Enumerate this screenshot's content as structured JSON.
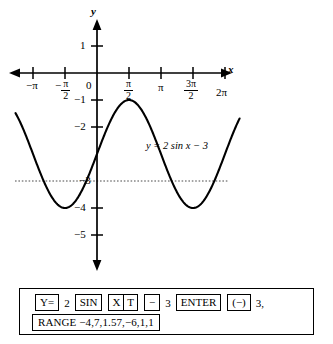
{
  "figure": {
    "equation_label": "y = 2 sin x − 3",
    "axis_labels": {
      "x": "x",
      "y": "y"
    }
  },
  "axes": {
    "x_ticks": [
      {
        "label": "−π",
        "value": -3.1416,
        "type": "plain"
      },
      {
        "label": "−π/2",
        "value": -1.5708,
        "type": "fraction",
        "sign": "−",
        "num": "π",
        "den": "2"
      },
      {
        "label": "0",
        "value": 0,
        "type": "plain"
      },
      {
        "label": "π/2",
        "value": 1.5708,
        "type": "fraction",
        "sign": "",
        "num": "π",
        "den": "2"
      },
      {
        "label": "π",
        "value": 3.1416,
        "type": "plain"
      },
      {
        "label": "3π/2",
        "value": 4.7124,
        "type": "fraction",
        "sign": "",
        "num": "3π",
        "den": "2"
      },
      {
        "label": "2π",
        "value": 6.2832,
        "type": "plain"
      }
    ],
    "y_ticks": [
      {
        "label": "1",
        "value": 1
      },
      {
        "label": "−1",
        "value": -1
      },
      {
        "label": "−2",
        "value": -2
      },
      {
        "label": "−3",
        "value": -3
      },
      {
        "label": "−4",
        "value": -4
      },
      {
        "label": "−5",
        "value": -5
      }
    ],
    "origin_label": "0",
    "x_arrow_left": true,
    "x_arrow_right": true,
    "y_arrow_up": true,
    "y_arrow_down": true
  },
  "chart_data": {
    "type": "line",
    "title": "",
    "subtitle": "",
    "xlabel": "x",
    "ylabel": "y",
    "xlim": [
      -4.0,
      7.0
    ],
    "ylim": [
      -6.0,
      1.6
    ],
    "grid": false,
    "legend": "none",
    "annotations": [
      {
        "text": "y = 2 sin x − 3",
        "x": 2.4,
        "y": -2.05
      }
    ],
    "series": [
      {
        "name": "y = 2 sin x − 3",
        "type": "line",
        "color": "#000000",
        "style": "solid",
        "amplitude": 2,
        "period": 6.2832,
        "vertical_shift": -3,
        "maximum": -1,
        "minimum": -5,
        "midline": -3,
        "key_points": [
          {
            "x": -3.1416,
            "y": -3
          },
          {
            "x": -1.5708,
            "y": -5
          },
          {
            "x": 0,
            "y": -3
          },
          {
            "x": 1.5708,
            "y": -1
          },
          {
            "x": 3.1416,
            "y": -3
          },
          {
            "x": 4.7124,
            "y": -5
          },
          {
            "x": 6.2832,
            "y": -3
          }
        ]
      },
      {
        "name": "midline y = −3",
        "type": "line",
        "color": "#555555",
        "style": "dotted",
        "constant": -3
      }
    ]
  },
  "keystrokes": {
    "row1": [
      {
        "kind": "key",
        "label": "Y="
      },
      {
        "kind": "plain",
        "label": "2"
      },
      {
        "kind": "key",
        "label": "SIN"
      },
      {
        "kind": "key-split",
        "left": "X",
        "right": "T"
      },
      {
        "kind": "key",
        "label": "−"
      },
      {
        "kind": "plain",
        "label": "3"
      },
      {
        "kind": "key",
        "label": "ENTER"
      },
      {
        "kind": "key",
        "label": "(−)"
      },
      {
        "kind": "plain",
        "label": "3,"
      }
    ],
    "row2": [
      {
        "kind": "key-range",
        "label": "RANGE −4,7,1.57,−6,1,1"
      }
    ]
  }
}
